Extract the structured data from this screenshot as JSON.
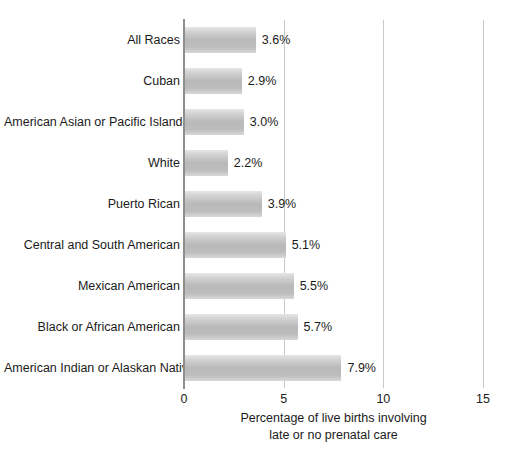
{
  "chart_data": {
    "type": "bar",
    "orientation": "horizontal",
    "title": "",
    "xlabel": "Percentage of live births involving late or no prenatal care",
    "xlabel_lines": [
      "Percentage of live births involving",
      "late or no prenatal care"
    ],
    "ylabel": "",
    "xlim": [
      0,
      15
    ],
    "xticks": [
      0,
      5,
      10,
      15
    ],
    "xtick_labels": [
      "0",
      "5",
      "10",
      "15"
    ],
    "grid": true,
    "grid_axis": "x",
    "legend": false,
    "categories": [
      "All Races",
      "Cuban",
      "American Asian or Pacific Islander",
      "White",
      "Puerto Rican",
      "Central and South American",
      "Mexican American",
      "Black or African American",
      "American Indian or Alaskan Native"
    ],
    "values": [
      3.6,
      2.9,
      3.0,
      2.2,
      3.9,
      5.1,
      5.5,
      5.7,
      7.9
    ],
    "value_labels": [
      "3.6%",
      "2.9%",
      "3.0%",
      "2.2%",
      "3.9%",
      "5.1%",
      "5.5%",
      "5.7%",
      "7.9%"
    ],
    "bars": [
      {
        "category": "All Races",
        "value": 3.6,
        "label": "3.6%"
      },
      {
        "category": "Cuban",
        "value": 2.9,
        "label": "2.9%"
      },
      {
        "category": "American Asian or Pacific Islander",
        "value": 3.0,
        "label": "3.0%"
      },
      {
        "category": "White",
        "value": 2.2,
        "label": "2.2%"
      },
      {
        "category": "Puerto Rican",
        "value": 3.9,
        "label": "3.9%"
      },
      {
        "category": "Central and South American",
        "value": 5.1,
        "label": "5.1%"
      },
      {
        "category": "Mexican American",
        "value": 5.5,
        "label": "5.5%"
      },
      {
        "category": "Black or African American",
        "value": 5.7,
        "label": "5.7%"
      },
      {
        "category": "American Indian or Alaskan Native",
        "value": 7.9,
        "label": "7.9%"
      }
    ],
    "colors": {
      "background": "#ffffff",
      "bar_light": "#e6e6e6",
      "bar_mid": "#b9b9b9",
      "axis": "#8e8e8e",
      "gridline": "#c9c9c9",
      "text": "#1b1b1b"
    }
  }
}
